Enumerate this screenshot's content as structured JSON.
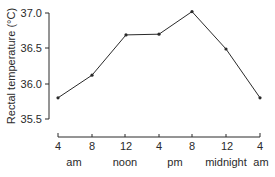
{
  "chart_data": {
    "type": "line",
    "title": "",
    "ylabel": "Rectal temperature (°C)",
    "xlabel": "",
    "ylim": [
      35.5,
      37.0
    ],
    "yticks": [
      "37.0",
      "36.5",
      "36.0",
      "35.5"
    ],
    "categories": [
      "4",
      "8",
      "12",
      "4",
      "8",
      "12",
      "4"
    ],
    "period_labels": [
      "am",
      "noon",
      "pm",
      "midnight",
      "am"
    ],
    "series": [
      {
        "name": "Rectal temperature",
        "values": [
          35.8,
          36.12,
          36.69,
          36.7,
          37.02,
          36.49,
          35.8
        ]
      }
    ],
    "grid": false,
    "legend": "none"
  },
  "colors": {
    "line": "#2a2a2a",
    "axis": "#2a2a2a"
  }
}
